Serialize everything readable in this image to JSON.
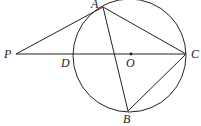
{
  "diagram": {
    "title": "",
    "circle": {
      "cx": 129.5,
      "cy": 55.5,
      "r": 56.5,
      "center_label": "O"
    },
    "points": {
      "P": {
        "label": "P",
        "x": 16,
        "y": 54,
        "lx": 4,
        "ly": 58
      },
      "A": {
        "label": "A",
        "x": 103,
        "y": 7,
        "lx": 91,
        "ly": 8
      },
      "C": {
        "label": "C",
        "x": 186,
        "y": 54,
        "lx": 191,
        "ly": 58
      },
      "O": {
        "label": "O",
        "x": 131,
        "y": 54,
        "lx": 126,
        "ly": 67
      },
      "D": {
        "label": "D",
        "x": 73,
        "y": 54,
        "lx": 61,
        "ly": 67
      },
      "B": {
        "label": "B",
        "x": 128,
        "y": 111,
        "lx": 123,
        "ly": 123
      }
    },
    "segments": [
      [
        "P",
        "A"
      ],
      [
        "P",
        "C"
      ],
      [
        "A",
        "C"
      ],
      [
        "A",
        "B"
      ],
      [
        "B",
        "C"
      ]
    ],
    "stroke_color": "#222222"
  }
}
